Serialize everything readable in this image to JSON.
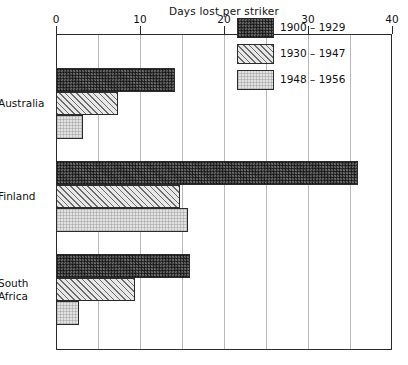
{
  "chart_data": {
    "type": "bar",
    "orientation": "horizontal",
    "title": "Days lost per striker",
    "xlabel": "Days lost per striker",
    "ylabel": "",
    "xlim": [
      0,
      40
    ],
    "xticks": [
      0,
      10,
      20,
      30,
      40
    ],
    "xtick_labels": [
      "0",
      "10",
      "20",
      "30",
      "40"
    ],
    "gridlines": [
      0,
      5,
      10,
      15,
      20,
      25,
      30,
      35,
      40
    ],
    "grid": true,
    "legend_position": "upper right",
    "categories": [
      "Australia",
      "Finland",
      "South\nAfrica"
    ],
    "series": [
      {
        "name": "1900 – 1929",
        "values": [
          14.2,
          35.9,
          16.0
        ],
        "pattern": "dark-crosshatch",
        "color": "#4a4a4a"
      },
      {
        "name": "1930 – 1947",
        "values": [
          7.4,
          14.8,
          9.4
        ],
        "pattern": "diagonal-hatch",
        "color": "#e8e8e8"
      },
      {
        "name": "1948 – 1956",
        "values": [
          3.2,
          15.7,
          2.7
        ],
        "pattern": "light-stipple",
        "color": "#e3e3e3"
      }
    ]
  }
}
